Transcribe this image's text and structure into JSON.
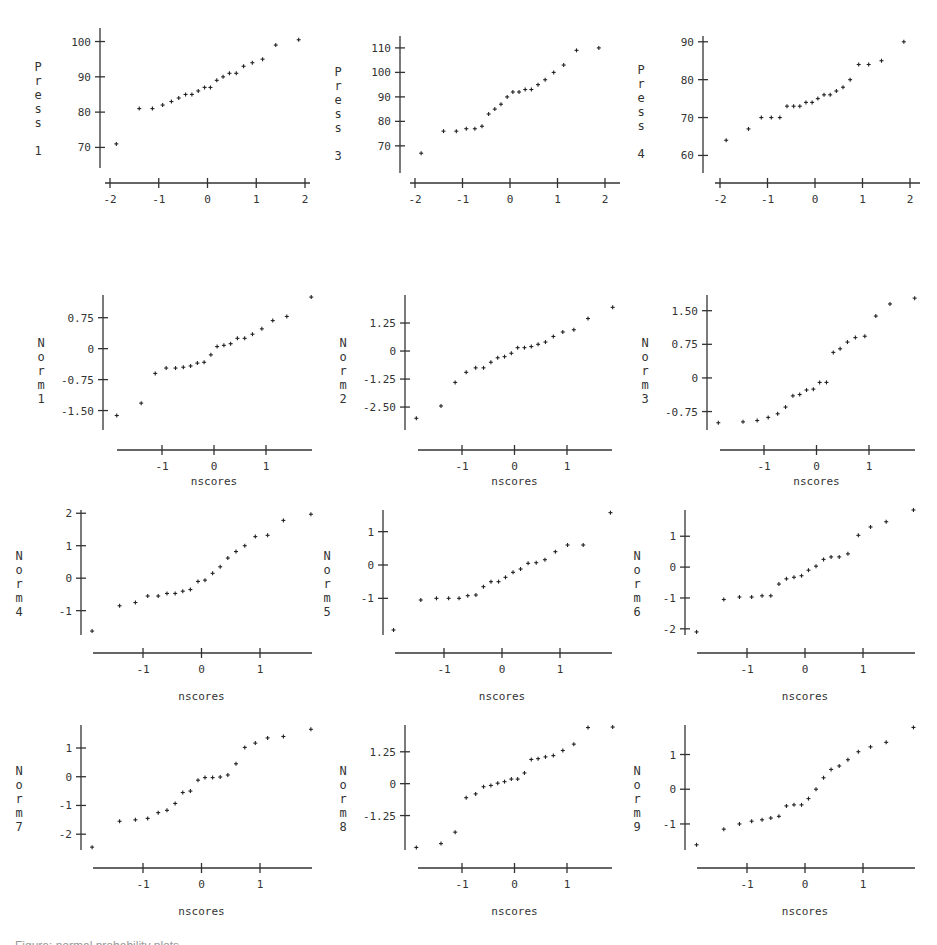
{
  "chart_data": [
    {
      "type": "scatter",
      "title": "",
      "xlabel": "nscores",
      "ylabel": "Press 1",
      "ylabel_lines": [
        "P",
        "r",
        "e",
        "s",
        "s",
        "",
        "1"
      ],
      "xlim": [
        -2.1,
        2.15
      ],
      "ylim": [
        67,
        101
      ],
      "xticks": [
        -2,
        -1,
        0,
        1,
        2
      ],
      "xtick_labels": [
        "-2",
        "-1",
        "0",
        "1",
        "2"
      ],
      "yticks": [
        70,
        80,
        90,
        100
      ],
      "ytick_labels": [
        "70",
        "80",
        "90",
        "100"
      ],
      "grid": false,
      "x": [
        -1.87,
        -1.4,
        -1.13,
        -0.92,
        -0.74,
        -0.59,
        -0.45,
        -0.32,
        -0.19,
        -0.06,
        0.06,
        0.19,
        0.32,
        0.45,
        0.59,
        0.74,
        0.92,
        1.13,
        1.4,
        1.87
      ],
      "y": [
        71,
        81,
        81,
        82,
        83,
        84,
        85,
        85,
        86,
        87,
        87,
        89,
        90,
        91,
        91,
        93,
        94,
        95,
        99,
        100.5
      ]
    },
    {
      "type": "scatter",
      "title": "",
      "xlabel": "nscores",
      "ylabel": "Press 3",
      "ylabel_lines": [
        "P",
        "r",
        "e",
        "s",
        "s",
        "",
        "3"
      ],
      "xlim": [
        -2.1,
        2.15
      ],
      "ylim": [
        63,
        112
      ],
      "xticks": [
        -2,
        -1,
        0,
        1,
        2
      ],
      "xtick_labels": [
        "-2",
        "-1",
        "0",
        "1",
        "2"
      ],
      "yticks": [
        70,
        80,
        90,
        100,
        110
      ],
      "ytick_labels": [
        "70",
        "80",
        "90",
        "100",
        "110"
      ],
      "grid": false,
      "x": [
        -1.87,
        -1.4,
        -1.13,
        -0.92,
        -0.74,
        -0.59,
        -0.45,
        -0.32,
        -0.19,
        -0.06,
        0.06,
        0.19,
        0.32,
        0.45,
        0.59,
        0.74,
        0.92,
        1.13,
        1.4,
        1.87
      ],
      "y": [
        67,
        76,
        76,
        77,
        77,
        78,
        83,
        85,
        87,
        90,
        92,
        92,
        93,
        93,
        95,
        97,
        100,
        103,
        109,
        110
      ]
    },
    {
      "type": "scatter",
      "title": "",
      "xlabel": "nscores",
      "ylabel": "Press 4",
      "ylabel_lines": [
        "P",
        "r",
        "e",
        "s",
        "s",
        "",
        "4"
      ],
      "xlim": [
        -2.1,
        2.15
      ],
      "ylim": [
        58,
        91
      ],
      "xticks": [
        -2,
        -1,
        0,
        1,
        2
      ],
      "xtick_labels": [
        "-2",
        "-1",
        "0",
        "1",
        "2"
      ],
      "yticks": [
        60,
        70,
        80,
        90
      ],
      "ytick_labels": [
        "60",
        "70",
        "80",
        "90"
      ],
      "grid": false,
      "x": [
        -1.87,
        -1.4,
        -1.13,
        -0.92,
        -0.74,
        -0.59,
        -0.45,
        -0.32,
        -0.19,
        -0.06,
        0.06,
        0.19,
        0.32,
        0.45,
        0.59,
        0.74,
        0.92,
        1.13,
        1.4,
        1.87
      ],
      "y": [
        64,
        67,
        70,
        70,
        70,
        73,
        73,
        73,
        74,
        74,
        75,
        76,
        76,
        77,
        78,
        80,
        84,
        84,
        85,
        90
      ]
    },
    {
      "type": "scatter",
      "title": "",
      "xlabel": "nscores",
      "ylabel": "Norm 1",
      "ylabel_lines": [
        "N",
        "o",
        "r",
        "m",
        "1"
      ],
      "xlim": [
        -1.95,
        1.95
      ],
      "ylim": [
        -1.85,
        1.3
      ],
      "xticks": [
        -1,
        0,
        1
      ],
      "xtick_labels": [
        "-1",
        "0",
        "1"
      ],
      "yticks": [
        -1.5,
        -0.75,
        0,
        0.75
      ],
      "ytick_labels": [
        "-1.50",
        "-0.75",
        "0",
        "0.75"
      ],
      "grid": false,
      "x": [
        -1.87,
        -1.4,
        -1.13,
        -0.92,
        -0.74,
        -0.59,
        -0.45,
        -0.32,
        -0.19,
        -0.06,
        0.06,
        0.19,
        0.32,
        0.45,
        0.59,
        0.74,
        0.92,
        1.13,
        1.4,
        1.87
      ],
      "y": [
        -1.62,
        -1.32,
        -0.6,
        -0.47,
        -0.47,
        -0.45,
        -0.42,
        -0.35,
        -0.33,
        -0.15,
        0.05,
        0.08,
        0.12,
        0.25,
        0.25,
        0.35,
        0.48,
        0.68,
        0.78,
        1.25
      ]
    },
    {
      "type": "scatter",
      "title": "",
      "xlabel": "nscores",
      "ylabel": "Norm 2",
      "ylabel_lines": [
        "N",
        "o",
        "r",
        "m",
        "2"
      ],
      "xlim": [
        -1.95,
        1.95
      ],
      "ylim": [
        -3.3,
        2.5
      ],
      "xticks": [
        -1,
        0,
        1
      ],
      "xtick_labels": [
        "-1",
        "0",
        "1"
      ],
      "yticks": [
        -2.5,
        -1.25,
        0,
        1.25
      ],
      "ytick_labels": [
        "-2.50",
        "-1.25",
        "0",
        "1.25"
      ],
      "grid": false,
      "x": [
        -1.87,
        -1.4,
        -1.13,
        -0.92,
        -0.74,
        -0.59,
        -0.45,
        -0.32,
        -0.19,
        -0.06,
        0.06,
        0.19,
        0.32,
        0.45,
        0.59,
        0.74,
        0.92,
        1.13,
        1.4,
        1.87
      ],
      "y": [
        -3.0,
        -2.45,
        -1.4,
        -0.95,
        -0.75,
        -0.75,
        -0.5,
        -0.3,
        -0.25,
        -0.1,
        0.15,
        0.15,
        0.2,
        0.3,
        0.4,
        0.65,
        0.85,
        0.95,
        1.45,
        1.95
      ]
    },
    {
      "type": "scatter",
      "title": "",
      "xlabel": "nscores",
      "ylabel": "Norm 3",
      "ylabel_lines": [
        "N",
        "o",
        "r",
        "m",
        "3"
      ],
      "xlim": [
        -1.95,
        1.95
      ],
      "ylim": [
        -1.05,
        1.85
      ],
      "xticks": [
        -1,
        0,
        1
      ],
      "xtick_labels": [
        "-1",
        "0",
        "1"
      ],
      "yticks": [
        -0.75,
        0,
        0.75,
        1.5
      ],
      "ytick_labels": [
        "-0.75",
        "0",
        "0.75",
        "1.50"
      ],
      "grid": false,
      "x": [
        -1.87,
        -1.4,
        -1.13,
        -0.92,
        -0.74,
        -0.59,
        -0.45,
        -0.32,
        -0.19,
        -0.06,
        0.06,
        0.19,
        0.32,
        0.45,
        0.59,
        0.74,
        0.92,
        1.13,
        1.4,
        1.87
      ],
      "y": [
        -1.0,
        -0.98,
        -0.95,
        -0.88,
        -0.8,
        -0.65,
        -0.4,
        -0.37,
        -0.27,
        -0.25,
        -0.1,
        -0.1,
        0.57,
        0.65,
        0.8,
        0.9,
        0.93,
        1.38,
        1.65,
        1.78
      ]
    },
    {
      "type": "scatter",
      "title": "",
      "xlabel": "nscores",
      "ylabel": "Norm 4",
      "ylabel_lines": [
        "N",
        "o",
        "r",
        "m",
        "4"
      ],
      "xlim": [
        -1.95,
        1.95
      ],
      "ylim": [
        -1.75,
        2.1
      ],
      "xticks": [
        -1,
        0,
        1
      ],
      "xtick_labels": [
        "-1",
        "0",
        "1"
      ],
      "yticks": [
        -1,
        0,
        1,
        2
      ],
      "ytick_labels": [
        "-1",
        "0",
        "1",
        "2"
      ],
      "grid": false,
      "x": [
        -1.87,
        -1.4,
        -1.13,
        -0.92,
        -0.74,
        -0.59,
        -0.45,
        -0.32,
        -0.19,
        -0.06,
        0.06,
        0.19,
        0.32,
        0.45,
        0.59,
        0.74,
        0.92,
        1.13,
        1.4,
        1.87
      ],
      "y": [
        -1.63,
        -0.85,
        -0.75,
        -0.55,
        -0.55,
        -0.47,
        -0.47,
        -0.4,
        -0.35,
        -0.1,
        -0.06,
        0.15,
        0.35,
        0.62,
        0.82,
        1.0,
        1.28,
        1.32,
        1.78,
        1.97
      ]
    },
    {
      "type": "scatter",
      "title": "",
      "xlabel": "nscores",
      "ylabel": "Norm 5",
      "ylabel_lines": [
        "N",
        "o",
        "r",
        "m",
        "5"
      ],
      "xlim": [
        -1.95,
        1.95
      ],
      "ylim": [
        -2.1,
        1.65
      ],
      "xticks": [
        -1,
        0,
        1
      ],
      "xtick_labels": [
        "-1",
        "0",
        "1"
      ],
      "yticks": [
        -1,
        0,
        1
      ],
      "ytick_labels": [
        "-1",
        "0",
        "1"
      ],
      "grid": false,
      "x": [
        -1.87,
        -1.4,
        -1.13,
        -0.92,
        -0.74,
        -0.59,
        -0.45,
        -0.32,
        -0.19,
        -0.06,
        0.06,
        0.19,
        0.32,
        0.45,
        0.59,
        0.74,
        0.92,
        1.13,
        1.4,
        1.87
      ],
      "y": [
        -1.95,
        -1.05,
        -1.0,
        -1.0,
        -1.0,
        -0.92,
        -0.9,
        -0.65,
        -0.5,
        -0.5,
        -0.37,
        -0.22,
        -0.12,
        0.05,
        0.07,
        0.16,
        0.4,
        0.6,
        0.6,
        1.57
      ]
    },
    {
      "type": "scatter",
      "title": "",
      "xlabel": "nscores",
      "ylabel": "Norm 6",
      "ylabel_lines": [
        "N",
        "o",
        "r",
        "m",
        "6"
      ],
      "xlim": [
        -1.95,
        1.95
      ],
      "ylim": [
        -2.2,
        1.85
      ],
      "xticks": [
        -1,
        0,
        1
      ],
      "xtick_labels": [
        "-1",
        "0",
        "1"
      ],
      "yticks": [
        -2,
        -1,
        0,
        1
      ],
      "ytick_labels": [
        "-2",
        "-1",
        "0",
        "1"
      ],
      "grid": false,
      "x": [
        -1.87,
        -1.4,
        -1.13,
        -0.92,
        -0.74,
        -0.59,
        -0.45,
        -0.32,
        -0.19,
        -0.06,
        0.06,
        0.19,
        0.32,
        0.45,
        0.59,
        0.74,
        0.92,
        1.13,
        1.4,
        1.87
      ],
      "y": [
        -2.1,
        -1.05,
        -0.97,
        -0.97,
        -0.93,
        -0.93,
        -0.55,
        -0.38,
        -0.33,
        -0.28,
        -0.1,
        0.03,
        0.25,
        0.33,
        0.33,
        0.43,
        1.03,
        1.3,
        1.47,
        1.85
      ]
    },
    {
      "type": "scatter",
      "title": "",
      "xlabel": "nscores",
      "ylabel": "Norm 7",
      "ylabel_lines": [
        "N",
        "o",
        "r",
        "m",
        "7"
      ],
      "xlim": [
        -1.95,
        1.95
      ],
      "ylim": [
        -2.55,
        1.8
      ],
      "xticks": [
        -1,
        0,
        1
      ],
      "xtick_labels": [
        "-1",
        "0",
        "1"
      ],
      "yticks": [
        -2,
        -1,
        0,
        1
      ],
      "ytick_labels": [
        "-2",
        "-1",
        "0",
        "1"
      ],
      "grid": false,
      "x": [
        -1.87,
        -1.4,
        -1.13,
        -0.92,
        -0.74,
        -0.59,
        -0.45,
        -0.32,
        -0.19,
        -0.06,
        0.06,
        0.19,
        0.32,
        0.45,
        0.59,
        0.74,
        0.92,
        1.13,
        1.4,
        1.87
      ],
      "y": [
        -2.45,
        -1.55,
        -1.5,
        -1.45,
        -1.25,
        -1.17,
        -0.93,
        -0.55,
        -0.5,
        -0.12,
        -0.03,
        -0.03,
        -0.01,
        0.06,
        0.45,
        1.02,
        1.17,
        1.35,
        1.4,
        1.65
      ]
    },
    {
      "type": "scatter",
      "title": "",
      "xlabel": "nscores",
      "ylabel": "Norm 8",
      "ylabel_lines": [
        "N",
        "o",
        "r",
        "m",
        "8"
      ],
      "xlim": [
        -1.95,
        1.95
      ],
      "ylim": [
        -2.6,
        2.3
      ],
      "xticks": [
        -1,
        0,
        1
      ],
      "xtick_labels": [
        "-1",
        "0",
        "1"
      ],
      "yticks": [
        -1.25,
        0,
        1.25
      ],
      "ytick_labels": [
        "-1.25",
        "0",
        "1.25"
      ],
      "grid": false,
      "x": [
        -1.87,
        -1.4,
        -1.13,
        -0.92,
        -0.74,
        -0.59,
        -0.45,
        -0.32,
        -0.19,
        -0.06,
        0.06,
        0.19,
        0.32,
        0.45,
        0.59,
        0.74,
        0.92,
        1.13,
        1.4,
        1.87
      ],
      "y": [
        -2.5,
        -2.35,
        -1.9,
        -0.55,
        -0.4,
        -0.12,
        -0.07,
        0.02,
        0.08,
        0.18,
        0.18,
        0.42,
        0.95,
        0.98,
        1.05,
        1.1,
        1.3,
        1.55,
        2.2,
        2.22
      ]
    },
    {
      "type": "scatter",
      "title": "",
      "xlabel": "nscores",
      "ylabel": "Norm 9",
      "ylabel_lines": [
        "N",
        "o",
        "r",
        "m",
        "9"
      ],
      "xlim": [
        -1.95,
        1.95
      ],
      "ylim": [
        -1.75,
        1.85
      ],
      "xticks": [
        -1,
        0,
        1
      ],
      "xtick_labels": [
        "-1",
        "0",
        "1"
      ],
      "yticks": [
        -1,
        0,
        1
      ],
      "ytick_labels": [
        "-1",
        "0",
        "1"
      ],
      "grid": false,
      "x": [
        -1.87,
        -1.4,
        -1.13,
        -0.92,
        -0.74,
        -0.59,
        -0.45,
        -0.32,
        -0.19,
        -0.06,
        0.06,
        0.19,
        0.32,
        0.45,
        0.59,
        0.74,
        0.92,
        1.13,
        1.4,
        1.87
      ],
      "y": [
        -1.6,
        -1.15,
        -1.0,
        -0.92,
        -0.88,
        -0.83,
        -0.78,
        -0.48,
        -0.45,
        -0.45,
        -0.27,
        0.0,
        0.33,
        0.57,
        0.67,
        0.85,
        1.08,
        1.22,
        1.35,
        1.78
      ]
    }
  ],
  "layout": {
    "panels": [
      {
        "left": 5,
        "top": 5,
        "plot": {
          "x0": 90,
          "y0": 8,
          "w": 195,
          "h": 140
        },
        "xaxis_y": 173,
        "axis_top": 8
      },
      {
        "left": 315,
        "top": 5,
        "plot": {
          "x0": 85,
          "y0": 8,
          "w": 195,
          "h": 150
        },
        "xaxis_y": 173,
        "axis_top": 8
      },
      {
        "left": 625,
        "top": 5,
        "plot": {
          "x0": 75,
          "y0": 8,
          "w": 195,
          "h": 150
        },
        "xaxis_y": 173,
        "axis_top": 8
      },
      {
        "left": 5,
        "top": 290,
        "plot": {
          "x0": 95,
          "y0": 8,
          "w": 200,
          "h": 125
        },
        "xaxis_y": 150,
        "axis_top": 8
      },
      {
        "left": 315,
        "top": 290,
        "plot": {
          "x0": 85,
          "y0": 8,
          "w": 200,
          "h": 125
        },
        "xaxis_y": 150,
        "axis_top": 8
      },
      {
        "left": 625,
        "top": 290,
        "plot": {
          "x0": 78,
          "y0": 8,
          "w": 200,
          "h": 125
        },
        "xaxis_y": 150,
        "axis_top": 8
      },
      {
        "left": 5,
        "top": 505,
        "plot": {
          "x0": 72,
          "y0": 5,
          "w": 230,
          "h": 125
        },
        "xaxis_y": 145,
        "axis_top": 5
      },
      {
        "left": 315,
        "top": 505,
        "plot": {
          "x0": 62,
          "y0": 5,
          "w": 230,
          "h": 125
        },
        "xaxis_y": 145,
        "axis_top": 5
      },
      {
        "left": 625,
        "top": 505,
        "plot": {
          "x0": 55,
          "y0": 5,
          "w": 230,
          "h": 125
        },
        "xaxis_y": 145,
        "axis_top": 5
      }
    ]
  },
  "caption": "Figure: normal probability plots"
}
